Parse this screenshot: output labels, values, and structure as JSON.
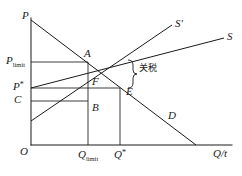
{
  "figure": {
    "type": "economics-supply-demand-diagram",
    "colors": {
      "line": "#1a1a1a",
      "background": "#ffffff"
    },
    "axes": {
      "vertical_label": "P",
      "horizontal_label": "Q/t",
      "origin_label": "O"
    },
    "price_ticks": [
      {
        "key": "p_limit",
        "base": "P",
        "sub": "limit",
        "y": 62
      },
      {
        "key": "p_star",
        "base": "P",
        "sup": "*",
        "y": 88
      },
      {
        "key": "c",
        "base": "C",
        "y": 101
      }
    ],
    "quantity_ticks": [
      {
        "key": "q_limit",
        "base": "Q",
        "sub": "limit",
        "x": 88
      },
      {
        "key": "q_star",
        "base": "Q",
        "sup": "*",
        "x": 120
      }
    ],
    "curves": [
      {
        "key": "supply_tariff",
        "label": "S'",
        "desc": "supply with tariff"
      },
      {
        "key": "supply",
        "label": "S",
        "desc": "world supply"
      },
      {
        "key": "demand",
        "label": "D",
        "desc": "domestic demand"
      }
    ],
    "points": [
      {
        "key": "A",
        "label": "A",
        "x": 88,
        "y": 62
      },
      {
        "key": "F",
        "label": "F",
        "x": 88,
        "y": 88
      },
      {
        "key": "B",
        "label": "B",
        "x": 88,
        "y": 101
      },
      {
        "key": "E",
        "label": "E",
        "x": 120,
        "y": 88
      }
    ],
    "annotation": {
      "text": "关税",
      "meaning": "tariff",
      "brace": "}"
    }
  }
}
